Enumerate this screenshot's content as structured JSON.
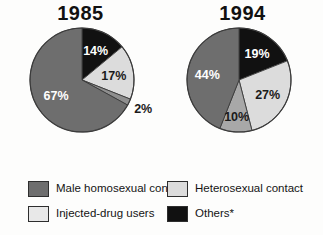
{
  "chart_data": [
    {
      "type": "pie",
      "title": "1985",
      "categories": [
        "Others*",
        "Injected-drug users",
        "Heterosexual contact",
        "Male homosexual contact"
      ],
      "values": [
        14,
        17,
        2,
        67
      ],
      "labels": [
        "14%",
        "17%",
        "2%",
        "67%"
      ],
      "colors": [
        "#111111",
        "#dcdcdc",
        "#8f8f8f",
        "#6e6e6e"
      ],
      "start_angle_deg": 0,
      "direction": "clockwise",
      "legend_position": "bottom",
      "units": "percent"
    },
    {
      "type": "pie",
      "title": "1994",
      "categories": [
        "Others*",
        "Heterosexual contact",
        "Injected-drug users",
        "Male homosexual contact"
      ],
      "values": [
        19,
        27,
        10,
        44
      ],
      "labels": [
        "19%",
        "27%",
        "10%",
        "44%"
      ],
      "colors": [
        "#111111",
        "#dcdcdc",
        "#a8a8a8",
        "#6e6e6e"
      ],
      "start_angle_deg": 0,
      "direction": "clockwise",
      "legend_position": "bottom",
      "units": "percent"
    }
  ],
  "charts": {
    "left": {
      "title": "1985",
      "slices": [
        {
          "label": "14%",
          "value": 14,
          "color": "#111111",
          "label_fill": "light"
        },
        {
          "label": "17%",
          "value": 17,
          "color": "#dcdcdc",
          "label_fill": "dark"
        },
        {
          "label": "2%",
          "value": 2,
          "color": "#8f8f8f",
          "label_fill": "dark"
        },
        {
          "label": "67%",
          "value": 67,
          "color": "#6e6e6e",
          "label_fill": "light"
        }
      ]
    },
    "right": {
      "title": "1994",
      "slices": [
        {
          "label": "19%",
          "value": 19,
          "color": "#111111",
          "label_fill": "light"
        },
        {
          "label": "27%",
          "value": 27,
          "color": "#dcdcdc",
          "label_fill": "dark"
        },
        {
          "label": "10%",
          "value": 10,
          "color": "#a8a8a8",
          "label_fill": "dark"
        },
        {
          "label": "44%",
          "value": 44,
          "color": "#6e6e6e",
          "label_fill": "light"
        }
      ]
    }
  },
  "legend": {
    "items": [
      {
        "label": "Male homosexual contact",
        "color": "#6e6e6e"
      },
      {
        "label": "Heterosexual contact",
        "color": "#dcdcdc"
      },
      {
        "label": "Injected-drug users",
        "color": "#e8e8e8"
      },
      {
        "label": "Others*",
        "color": "#111111"
      }
    ]
  }
}
